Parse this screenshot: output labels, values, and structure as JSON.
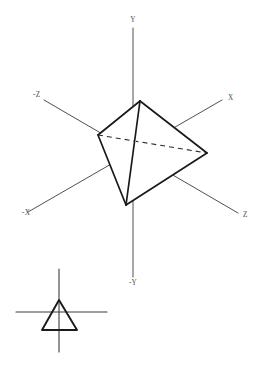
{
  "figure": {
    "background_color": "#ffffff",
    "line_color": "#1a1a1a",
    "axis_color": "#3c3c3c",
    "label_color": "#4a4a4a"
  },
  "axes": {
    "origin": {
      "x": 133,
      "y": 154
    },
    "labels": {
      "y_positive": "Y",
      "y_negative": "-Y",
      "x_positive": "X",
      "x_negative": "-X",
      "z_positive": "Z",
      "z_negative": "-Z"
    },
    "label_positions": {
      "y_positive": {
        "x": 133,
        "y": 22
      },
      "y_negative": {
        "x": 133,
        "y": 285
      },
      "x_positive": {
        "x": 228,
        "y": 100
      },
      "x_negative": {
        "x": 22,
        "y": 215
      },
      "z_positive": {
        "x": 243,
        "y": 217
      },
      "z_negative": {
        "x": 33,
        "y": 97
      }
    },
    "segments": [
      {
        "name": "y-axis",
        "x1": 133,
        "y1": 28,
        "x2": 133,
        "y2": 277
      },
      {
        "name": "x-axis",
        "x1": 28,
        "y1": 212,
        "x2": 222,
        "y2": 100
      },
      {
        "name": "z-axis",
        "x1": 44,
        "y1": 100,
        "x2": 238,
        "y2": 213
      }
    ]
  },
  "solid": {
    "name": "tetrahedron",
    "vertices": {
      "top": {
        "x": 140,
        "y": 101
      },
      "left": {
        "x": 98,
        "y": 135
      },
      "right": {
        "x": 207,
        "y": 153
      },
      "bottom": {
        "x": 126,
        "y": 205
      }
    },
    "visible_edges": [
      {
        "from": "top",
        "to": "left"
      },
      {
        "from": "top",
        "to": "right"
      },
      {
        "from": "top",
        "to": "bottom"
      },
      {
        "from": "left",
        "to": "bottom"
      },
      {
        "from": "right",
        "to": "bottom"
      }
    ],
    "hidden_edges": [
      {
        "from": "left",
        "to": "right"
      }
    ]
  },
  "inset": {
    "name": "triangle-on-axes",
    "triangle": {
      "apex": {
        "x": 59,
        "y": 300
      },
      "left": {
        "x": 42,
        "y": 330
      },
      "right": {
        "x": 77,
        "y": 330
      }
    },
    "vertical_axis": {
      "x1": 59,
      "y1": 269,
      "x2": 59,
      "y2": 352
    },
    "horizontal_axis": {
      "x1": 16,
      "y1": 312,
      "x2": 107,
      "y2": 312
    }
  }
}
